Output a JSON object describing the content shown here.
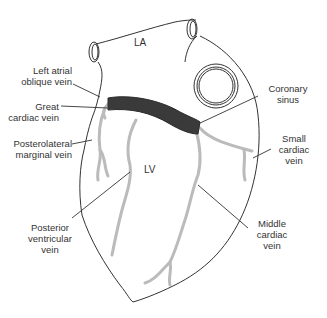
{
  "diagram": {
    "chambers": {
      "la": "LA",
      "lv": "LV"
    },
    "labels": {
      "left_atrial_oblique_vein": "Left atrial\noblique vein",
      "great_cardiac_vein": "Great\ncardiac vein",
      "posterolateral_marginal_vein": "Posterolateral\nmarginal vein",
      "posterior_ventricular_vein": "Posterior\nventricular\nvein",
      "coronary_sinus": "Coronary\nsinus",
      "small_cardiac_vein": "Small\ncardiac\nvein",
      "middle_cardiac_vein": "Middle\ncardiac\nvein"
    },
    "colors": {
      "outline": "#333333",
      "veins": "#bbbbbb",
      "coronary_sinus_fill": "#3a3a3a",
      "leader_lines": "#333333",
      "text": "#333333"
    }
  }
}
